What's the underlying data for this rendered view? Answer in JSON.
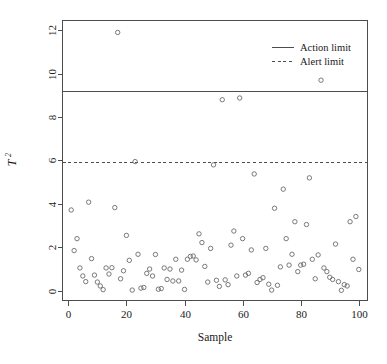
{
  "chart_data": {
    "type": "scatter",
    "title": "",
    "xlabel": "Sample",
    "ylabel": "T²",
    "ylabel_base": "T",
    "ylabel_exponent": "2",
    "xlim": [
      -2,
      103
    ],
    "ylim": [
      -0.45,
      12.45
    ],
    "grid": false,
    "x_ticks": [
      0,
      20,
      40,
      60,
      80,
      100
    ],
    "x_tick_labels": [
      "0",
      "20",
      "40",
      "60",
      "80",
      "100"
    ],
    "y_ticks": [
      0,
      2,
      4,
      6,
      8,
      10,
      12
    ],
    "y_tick_labels": [
      "0",
      "2",
      "4",
      "6",
      "8",
      "10",
      "12"
    ],
    "marker": "open-circle",
    "marker_color": "#6b6b6b",
    "axis_color": "#4d4d4d",
    "legend": {
      "position": "top-right",
      "entries": [
        {
          "label": "Action limit",
          "style": "solid",
          "color": "#4d4d4d"
        },
        {
          "label": "Alert limit",
          "style": "dashed",
          "color": "#4d4d4d"
        }
      ]
    },
    "reference_lines": [
      {
        "name": "Action limit",
        "value": 9.2,
        "style": "solid",
        "color": "#4d4d4d"
      },
      {
        "name": "Alert limit",
        "value": 5.95,
        "style": "dashed",
        "color": "#4d4d4d"
      }
    ],
    "series": [
      {
        "name": "T2",
        "x": [
          1,
          2,
          3,
          4,
          5,
          6,
          7,
          8,
          9,
          10,
          11,
          12,
          13,
          14,
          15,
          16,
          17,
          18,
          19,
          20,
          21,
          22,
          23,
          24,
          25,
          26,
          27,
          28,
          29,
          30,
          31,
          32,
          33,
          34,
          35,
          36,
          37,
          38,
          39,
          40,
          41,
          42,
          43,
          44,
          45,
          46,
          47,
          48,
          49,
          50,
          51,
          52,
          53,
          54,
          55,
          56,
          57,
          58,
          59,
          60,
          61,
          62,
          63,
          64,
          65,
          66,
          67,
          68,
          69,
          70,
          71,
          72,
          73,
          74,
          75,
          76,
          77,
          78,
          79,
          80,
          81,
          82,
          83,
          84,
          85,
          86,
          87,
          88,
          89,
          90,
          91,
          92,
          93,
          94,
          95,
          96,
          97,
          98,
          99,
          100
        ],
        "y": [
          3.72,
          1.85,
          2.4,
          1.05,
          0.68,
          0.42,
          4.08,
          1.48,
          0.72,
          0.4,
          0.22,
          0.05,
          1.05,
          0.77,
          1.06,
          3.83,
          11.9,
          0.55,
          0.92,
          2.55,
          1.4,
          0.03,
          5.95,
          1.68,
          0.12,
          0.15,
          0.8,
          1.0,
          0.68,
          1.67,
          0.07,
          0.1,
          1.05,
          0.52,
          1.0,
          0.45,
          1.45,
          0.45,
          0.95,
          0.06,
          1.45,
          1.58,
          1.6,
          1.42,
          2.62,
          2.22,
          1.12,
          0.4,
          1.95,
          5.8,
          0.48,
          0.2,
          8.8,
          0.5,
          0.28,
          2.1,
          2.75,
          0.68,
          8.88,
          2.4,
          0.72,
          0.8,
          1.88,
          5.38,
          0.38,
          0.52,
          0.6,
          1.95,
          0.3,
          0.03,
          3.8,
          0.25,
          1.1,
          4.68,
          2.4,
          1.18,
          1.68,
          3.18,
          0.88,
          1.18,
          1.22,
          3.05,
          5.2,
          1.45,
          0.55,
          1.65,
          9.7,
          1.05,
          0.88,
          0.62,
          0.52,
          2.15,
          0.42,
          0.02,
          0.28,
          0.22,
          3.18,
          1.45,
          3.42,
          0.98
        ]
      }
    ]
  }
}
